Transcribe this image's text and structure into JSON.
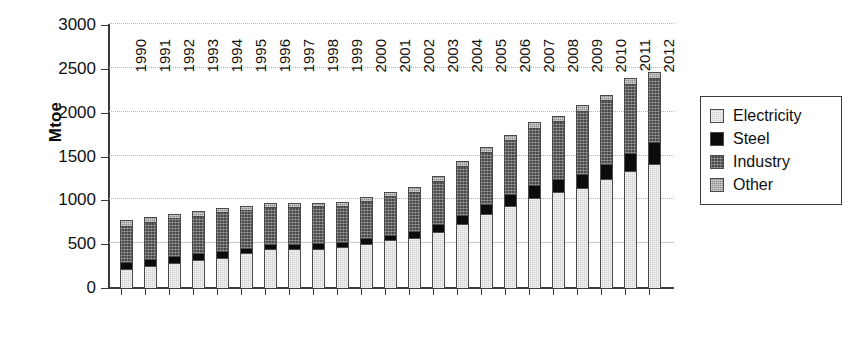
{
  "chart_data": {
    "type": "bar",
    "subtype": "stacked-vertical",
    "title": "",
    "xlabel": "",
    "ylabel": "Mtoe",
    "ylim": [
      0,
      3000
    ],
    "yticks": [
      0,
      500,
      1000,
      1500,
      2000,
      2500,
      3000
    ],
    "ytick_labels": [
      "0",
      "500",
      "1000",
      "1500",
      "2000",
      "2500",
      "3000"
    ],
    "grid": "horizontal-dotted",
    "legend_position": "right",
    "categories": [
      "1990",
      "1991",
      "1992",
      "1993",
      "1994",
      "1995",
      "1996",
      "1997",
      "1998",
      "1999",
      "2000",
      "2001",
      "2002",
      "2003",
      "2004",
      "2005",
      "2006",
      "2007",
      "2008",
      "2009",
      "2010",
      "2011",
      "2012"
    ],
    "series": [
      {
        "name": "Electricity",
        "color": "#cfcfcf",
        "values": [
          215,
          255,
          290,
          320,
          345,
          395,
          440,
          440,
          450,
          465,
          505,
          545,
          575,
          640,
          725,
          840,
          935,
          1025,
          1090,
          1145,
          1240,
          1340,
          1415
        ]
      },
      {
        "name": "Steel",
        "color": "#0b0b0b",
        "values": [
          80,
          80,
          75,
          75,
          75,
          65,
          65,
          65,
          60,
          60,
          65,
          60,
          70,
          90,
          110,
          115,
          135,
          145,
          150,
          160,
          175,
          200,
          250
        ]
      },
      {
        "name": "Industry",
        "color": "#4a4a4a",
        "values": [
          410,
          420,
          430,
          430,
          445,
          430,
          420,
          420,
          420,
          415,
          425,
          440,
          455,
          490,
          555,
          595,
          615,
          655,
          660,
          715,
          725,
          790,
          730
        ]
      },
      {
        "name": "Other",
        "color": "#8f8f8f",
        "values": [
          75,
          55,
          50,
          50,
          45,
          40,
          50,
          45,
          45,
          40,
          45,
          45,
          50,
          55,
          60,
          60,
          65,
          65,
          65,
          65,
          65,
          65,
          70
        ]
      }
    ],
    "totals": [
      780,
      810,
      845,
      875,
      910,
      930,
      975,
      970,
      975,
      980,
      1040,
      1090,
      1150,
      1275,
      1450,
      1610,
      1750,
      1890,
      1965,
      2085,
      2205,
      2395,
      2465
    ]
  },
  "legend": {
    "items": [
      {
        "label": "Electricity",
        "color": "#cfcfcf"
      },
      {
        "label": "Steel",
        "color": "#0b0b0b"
      },
      {
        "label": "Industry",
        "color": "#4a4a4a"
      },
      {
        "label": "Other",
        "color": "#8f8f8f"
      }
    ]
  }
}
